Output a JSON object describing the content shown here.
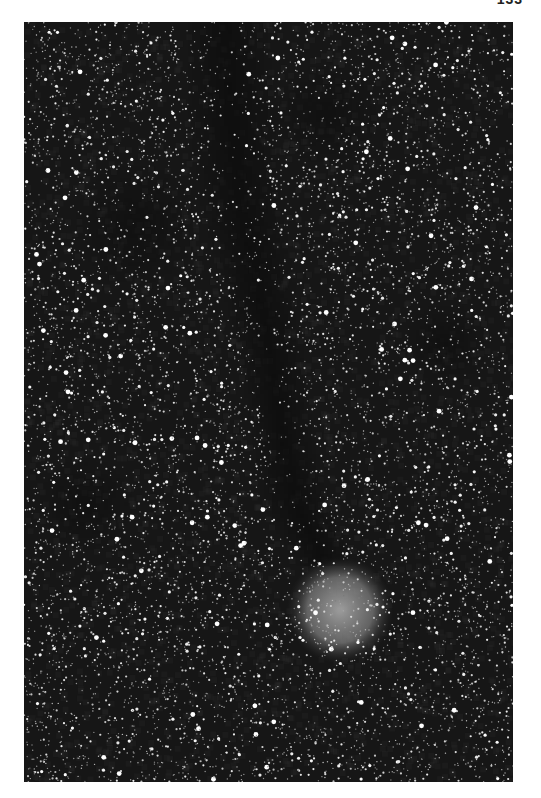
{
  "page": {
    "number": "133",
    "background": "#ffffff"
  },
  "photo": {
    "description": "Black and white astrophotograph: dense Milky Way starfield with a dark nebula lane running vertically, ending at a faint round emission nebula near the bottom",
    "x": 24,
    "y": 22,
    "width": 489,
    "height": 760,
    "sky_color": "#161616",
    "star_count": 9000,
    "seed": 133,
    "nebula": {
      "cx": 316,
      "cy": 588,
      "r": 38,
      "color": "#a8a8a8"
    },
    "dark_lane": [
      {
        "x": 200,
        "y": 0,
        "w": 40
      },
      {
        "x": 205,
        "y": 80,
        "w": 45
      },
      {
        "x": 215,
        "y": 180,
        "w": 40
      },
      {
        "x": 240,
        "y": 300,
        "w": 35
      },
      {
        "x": 255,
        "y": 400,
        "w": 30
      },
      {
        "x": 270,
        "y": 480,
        "w": 35
      },
      {
        "x": 300,
        "y": 540,
        "w": 30
      }
    ],
    "dark_patches": [
      {
        "cx": 110,
        "cy": 200,
        "r": 60
      },
      {
        "cx": 300,
        "cy": 90,
        "r": 50
      },
      {
        "cx": 420,
        "cy": 320,
        "r": 40
      },
      {
        "cx": 60,
        "cy": 480,
        "r": 45
      }
    ]
  }
}
